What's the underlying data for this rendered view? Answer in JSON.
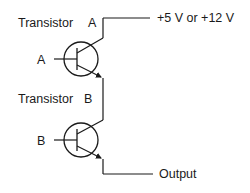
{
  "diagram": {
    "type": "darlington-pair-schematic",
    "colors": {
      "line": "#1a1a1a",
      "background": "#ffffff"
    },
    "labels": {
      "transistor_a_title": "Transistor",
      "transistor_a_letter": "A",
      "transistor_a_input": "A",
      "transistor_b_title": "Transistor",
      "transistor_b_letter": "B",
      "transistor_b_input": "B",
      "supply": "+5 V or +12 V",
      "output": "Output"
    },
    "components": [
      {
        "id": "transistor-a",
        "kind": "NPN transistor",
        "label": "Transistor A",
        "input_label": "A"
      },
      {
        "id": "transistor-b",
        "kind": "NPN transistor",
        "label": "Transistor B",
        "input_label": "B"
      }
    ],
    "connections": [
      {
        "from": "supply",
        "to": "transistor-a collector",
        "label": "+5 V or +12 V"
      },
      {
        "from": "transistor-a emitter",
        "to": "transistor-b collector"
      },
      {
        "from": "transistor-b emitter",
        "to": "output",
        "label": "Output"
      }
    ]
  }
}
